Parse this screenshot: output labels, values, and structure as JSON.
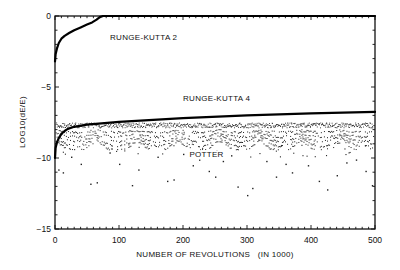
{
  "chart_data": {
    "type": "line",
    "title": "",
    "xlabel": "NUMBER OF REVOLUTIONS   (IN 1000)",
    "ylabel": "LOG10(dE/E)",
    "xlim": [
      0,
      500
    ],
    "ylim": [
      -15,
      0
    ],
    "xticks": [
      0,
      100,
      200,
      300,
      400,
      500
    ],
    "xtick_labels": [
      "0",
      "100",
      "200",
      "300",
      "400",
      "500"
    ],
    "yticks": [
      0,
      -5,
      -10,
      -15
    ],
    "ytick_labels": [
      "0",
      "-5",
      "-10",
      "-15"
    ],
    "grid": false,
    "legend": "inline labels",
    "series": [
      {
        "name": "RUNGE-KUTTA 2",
        "style": "thick-line",
        "x": [
          0,
          1,
          3,
          6,
          10,
          15,
          22,
          30,
          40,
          50,
          58,
          65,
          70,
          75,
          500
        ],
        "y": [
          -3.2,
          -2.7,
          -2.3,
          -1.9,
          -1.6,
          -1.4,
          -1.2,
          -1.0,
          -0.8,
          -0.6,
          -0.45,
          -0.25,
          -0.08,
          0,
          0
        ]
      },
      {
        "name": "RUNGE-KUTTA 4",
        "style": "thick-line",
        "x": [
          0,
          1,
          3,
          6,
          10,
          15,
          20,
          30,
          50,
          100,
          200,
          300,
          400,
          500
        ],
        "y": [
          -10.0,
          -9.3,
          -8.9,
          -8.6,
          -8.3,
          -8.1,
          -7.95,
          -7.8,
          -7.65,
          -7.45,
          -7.2,
          -7.0,
          -6.85,
          -6.75
        ]
      },
      {
        "name": "POTTER",
        "style": "scatter-dots",
        "band_top": -7.5,
        "band_dense_bottom": -9.0,
        "arch_period_k": 64,
        "outliers": [
          {
            "x": 5,
            "y": -10.8
          },
          {
            "x": 12,
            "y": -11.0
          },
          {
            "x": 25,
            "y": -9.9
          },
          {
            "x": 40,
            "y": -10.4
          },
          {
            "x": 55,
            "y": -11.8
          },
          {
            "x": 65,
            "y": -11.7
          },
          {
            "x": 85,
            "y": -9.6
          },
          {
            "x": 100,
            "y": -10.4
          },
          {
            "x": 120,
            "y": -11.9
          },
          {
            "x": 130,
            "y": -10.8
          },
          {
            "x": 160,
            "y": -9.9
          },
          {
            "x": 175,
            "y": -11.6
          },
          {
            "x": 185,
            "y": -11.5
          },
          {
            "x": 200,
            "y": -9.7
          },
          {
            "x": 215,
            "y": -10.5
          },
          {
            "x": 225,
            "y": -10.1
          },
          {
            "x": 240,
            "y": -10.9
          },
          {
            "x": 250,
            "y": -11.3
          },
          {
            "x": 262,
            "y": -10.2
          },
          {
            "x": 275,
            "y": -9.8
          },
          {
            "x": 285,
            "y": -12.0
          },
          {
            "x": 300,
            "y": -12.6
          },
          {
            "x": 308,
            "y": -12.1
          },
          {
            "x": 330,
            "y": -10.2
          },
          {
            "x": 345,
            "y": -11.3
          },
          {
            "x": 360,
            "y": -10.4
          },
          {
            "x": 370,
            "y": -11.0
          },
          {
            "x": 395,
            "y": -10.5
          },
          {
            "x": 412,
            "y": -11.6
          },
          {
            "x": 425,
            "y": -12.2
          },
          {
            "x": 440,
            "y": -11.2
          },
          {
            "x": 455,
            "y": -10.3
          },
          {
            "x": 470,
            "y": -10.1
          },
          {
            "x": 485,
            "y": -10.9
          },
          {
            "x": 495,
            "y": -11.9
          }
        ]
      }
    ],
    "annotations": [
      {
        "text": "RUNGE-KUTTA 2",
        "x": 86,
        "y": -1.7
      },
      {
        "text": "RUNGE-KUTTA 4",
        "x": 200,
        "y": -6.0
      },
      {
        "text": "POTTER",
        "x": 210,
        "y": -9.95
      }
    ]
  }
}
